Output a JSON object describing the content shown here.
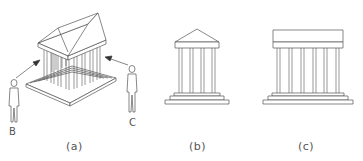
{
  "figure": {
    "panels": [
      {
        "id": "a",
        "label": "(a)",
        "description": "isometric temple with two viewers"
      },
      {
        "id": "b",
        "label": "(b)",
        "description": "front elevation with pediment, 4 columns"
      },
      {
        "id": "c",
        "label": "(c)",
        "description": "side elevation with flat entablature, 6 columns"
      }
    ],
    "viewers": [
      {
        "id": "B",
        "label": "B"
      },
      {
        "id": "C",
        "label": "C"
      }
    ],
    "colors": {
      "stroke": "#555555",
      "fill": "#ffffff"
    }
  }
}
